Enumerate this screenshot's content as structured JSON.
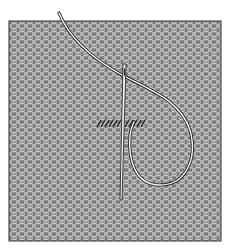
{
  "illustration": {
    "subject": "needle-and-thread-on-woven-canvas",
    "colors": {
      "background": "#ffffff",
      "fabric_base": "#8a8a8a",
      "fabric_dark": "#3a3a3a",
      "fabric_light": "#e8e8e8",
      "thread_fill": "#f4f4f4",
      "thread_outline": "#2a2a2a"
    },
    "fabric_rect": {
      "x": 9,
      "y": 21,
      "w": 212,
      "h": 220
    },
    "stitch_row": {
      "x1": 96,
      "x2": 146,
      "y": 124
    }
  }
}
